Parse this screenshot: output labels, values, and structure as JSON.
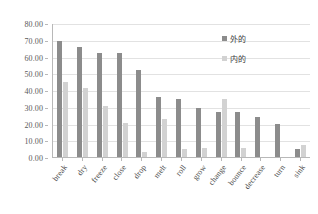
{
  "chart_data": {
    "type": "bar",
    "title": "",
    "subtitle": "",
    "xlabel": "",
    "ylabel": "",
    "ylim": [
      0,
      80
    ],
    "ytick_step": 10,
    "grid": true,
    "legend_position": "inside-top-right",
    "ytick_labels": [
      "80.00",
      "70.00",
      "60.00",
      "50.00",
      "40.00",
      "30.00",
      "20.00",
      "10.00",
      "0.00"
    ],
    "ytick_values": [
      80,
      70,
      60,
      50,
      40,
      30,
      20,
      10,
      0
    ],
    "categories": [
      "break",
      "dry",
      "freeze",
      "close",
      "drop",
      "melt",
      "roll",
      "grow",
      "change",
      "bounce",
      "decrease",
      "turn",
      "sink"
    ],
    "series": [
      {
        "name": "外的",
        "color": "#8c8c8c",
        "values": [
          69.0,
          65.5,
          62.0,
          62.0,
          52.0,
          36.0,
          34.5,
          29.0,
          27.0,
          27.0,
          24.0,
          19.5,
          5.0
        ]
      },
      {
        "name": "内的",
        "color": "#d2d2d2",
        "values": [
          44.5,
          41.0,
          30.5,
          20.5,
          3.0,
          22.5,
          5.0,
          5.5,
          34.5,
          5.5,
          0.0,
          0.0,
          7.0
        ]
      }
    ]
  },
  "legend": {
    "items": [
      {
        "label": "外的"
      },
      {
        "label": "内的"
      }
    ]
  },
  "colors": {
    "series_outer": "#8c8c8c",
    "series_inner": "#d2d2d2",
    "gridline": "#e2e2e2",
    "axis": "#b8b8b8",
    "text": "#4a4a4a",
    "background": "#ffffff"
  }
}
